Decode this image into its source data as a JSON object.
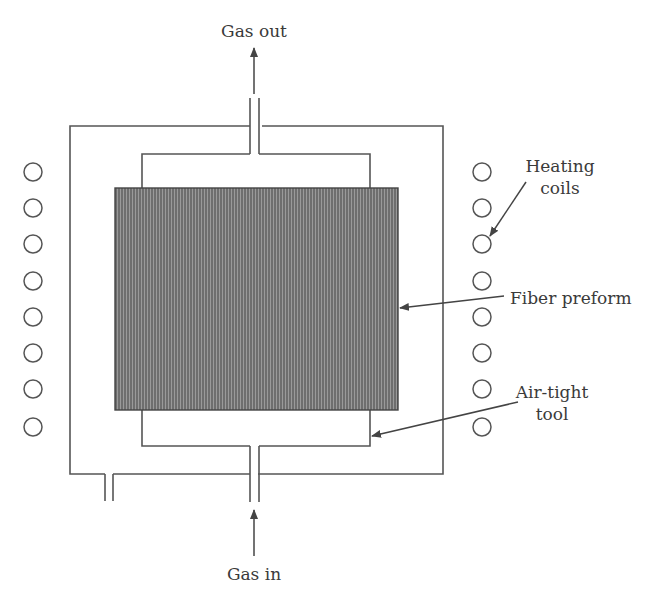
{
  "diagram": {
    "type": "schematic",
    "colors": {
      "line": "#555555",
      "preform_fill": "#6a6a6a",
      "preform_stripe": "#8a8a8a",
      "text": "#3a3a3a",
      "background": "#ffffff"
    },
    "labels": {
      "gas_out": "Gas out",
      "gas_in": "Gas in",
      "heating_coils_line1": "Heating",
      "heating_coils_line2": "coils",
      "fiber_preform": "Fiber preform",
      "air_tight_tool_line1": "Air-tight",
      "air_tight_tool_line2": "tool"
    },
    "coils": {
      "count_per_side": 8,
      "left_x": 33,
      "right_x": 482,
      "y_positions": [
        172,
        208,
        244,
        281,
        317,
        353,
        389,
        427
      ],
      "radius": 9
    }
  }
}
